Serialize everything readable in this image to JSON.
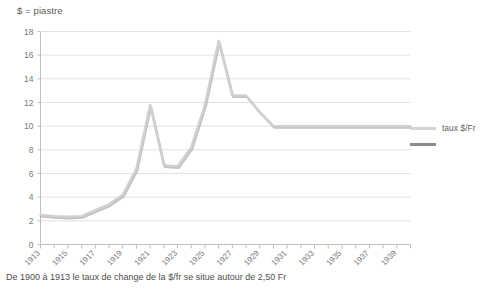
{
  "chart_data": {
    "type": "line",
    "title": "$ = piastre",
    "xlabel": "",
    "ylabel": "",
    "ylim": [
      0,
      18
    ],
    "ytick_step": 2,
    "yticks": [
      0,
      2,
      4,
      6,
      8,
      10,
      12,
      14,
      16,
      18
    ],
    "xlim": [
      1913,
      1940
    ],
    "xticks": [
      1913,
      1915,
      1917,
      1919,
      1921,
      1923,
      1925,
      1927,
      1929,
      1931,
      1933,
      1935,
      1937,
      1939
    ],
    "xtick_labels": [
      "1913",
      "1915",
      "1917",
      "1919",
      "1921",
      "1923",
      "1925",
      "1927",
      "1929",
      "1931",
      "1933",
      "1935",
      "1937",
      "1939"
    ],
    "grid": true,
    "legend_position": "right",
    "series": [
      {
        "name": "taux $/Fr",
        "color": "#d0d0d0",
        "shadow_color": "#8f8f8f",
        "x": [
          1913,
          1914,
          1915,
          1916,
          1917,
          1918,
          1919,
          1920,
          1921,
          1922,
          1923,
          1924,
          1925,
          1926,
          1927,
          1928,
          1929,
          1930,
          1931,
          1932,
          1933,
          1934,
          1935,
          1936,
          1937,
          1938,
          1939,
          1940
        ],
        "values": [
          2.5,
          2.4,
          2.35,
          2.4,
          2.9,
          3.4,
          4.2,
          6.4,
          11.8,
          6.7,
          6.6,
          8.2,
          11.8,
          17.2,
          12.6,
          12.6,
          11.2,
          10.0,
          10.0,
          10.0,
          10.0,
          10.0,
          10.0,
          10.0,
          10.0,
          10.0,
          10.0,
          10.0
        ]
      }
    ],
    "legend_entries": [
      {
        "label": "taux $/Fr",
        "swatch": "light"
      },
      {
        "label": "",
        "swatch": "dark"
      }
    ],
    "footnote": "De 1900 à 1913 le taux de change de la $/fr se situe autour de 2,50 Fr"
  },
  "colors": {
    "grid": "#e2e2e2",
    "axis": "#bfbfbf",
    "line": "#d0d0d0",
    "line_shadow": "#8f8f8f",
    "text": "#7a7a7a"
  }
}
